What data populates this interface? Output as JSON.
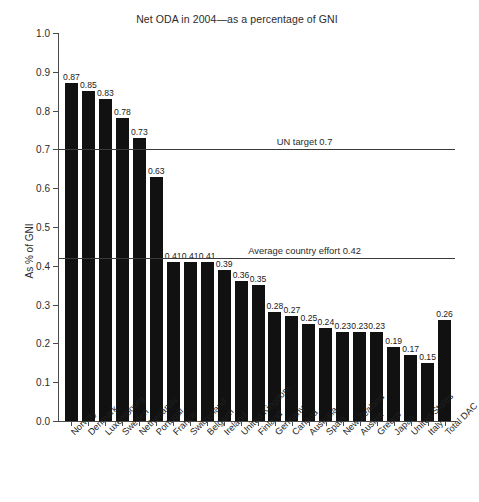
{
  "chart_data": {
    "type": "bar",
    "title": "Net ODA in 2004—as a percentage of GNI",
    "xlabel": "",
    "ylabel": "As % of GNI",
    "ylim": [
      0.0,
      1.0
    ],
    "ytick_labels": [
      "0.0",
      "0.1",
      "0.2",
      "0.3",
      "0.4",
      "0.5",
      "0.6",
      "0.7",
      "0.8",
      "0.9",
      "1.0"
    ],
    "ytick_values": [
      0.0,
      0.1,
      0.2,
      0.3,
      0.4,
      0.5,
      0.6,
      0.7,
      0.8,
      0.9,
      1.0
    ],
    "grid": false,
    "legend": "none",
    "bar_color": "#111111",
    "categories": [
      "Norway",
      "Denmark",
      "Luxembourg",
      "Sweden",
      "Netherlands",
      "Portugal",
      "France",
      "Switzerland",
      "Belgium",
      "Ireland",
      "United Kingdom",
      "Finland",
      "Germany",
      "Canada",
      "Australia",
      "Spain",
      "New Zealand",
      "Austria",
      "Greece",
      "Japan",
      "United States",
      "Italy",
      "Total DAC"
    ],
    "values": [
      0.87,
      0.85,
      0.83,
      0.78,
      0.73,
      0.63,
      0.41,
      0.41,
      0.41,
      0.39,
      0.36,
      0.35,
      0.28,
      0.27,
      0.25,
      0.24,
      0.23,
      0.23,
      0.23,
      0.19,
      0.17,
      0.15,
      0.26
    ],
    "value_labels": [
      "0.87",
      "0.85",
      "0.83",
      "0.78",
      "0.73",
      "0.63",
      "0.41",
      "0.41",
      "0.41",
      "0.39",
      "0.36",
      "0.35",
      "0.28",
      "0.27",
      "0.25",
      "0.24",
      "0.23",
      "0.23",
      "0.23",
      "0.19",
      "0.17",
      "0.15",
      "0.26"
    ],
    "reference_lines": [
      {
        "label": "UN target 0.7",
        "value": 0.7,
        "label_x_frac": 0.62
      },
      {
        "label": "Average country effort 0.42",
        "value": 0.42,
        "label_x_frac": 0.62
      }
    ]
  }
}
